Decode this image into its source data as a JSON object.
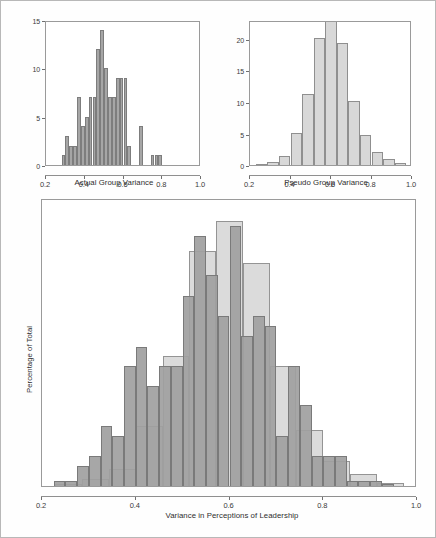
{
  "figure": {
    "background": "#ffffff",
    "frame_color": "#b8b8b8",
    "dark_color": "#a6a6a6",
    "light_color": "#d8d8d8"
  },
  "chart_data": [
    {
      "type": "bar",
      "id": "actual-group-variance",
      "title": "",
      "xlabel": "Actual Group Variance",
      "ylabel": "",
      "xlim": [
        0.2,
        1.0
      ],
      "ylim": [
        0,
        15
      ],
      "xticks": [
        "0.2",
        "0.4",
        "0.6",
        "0.8",
        "1.0"
      ],
      "xtick_values": [
        0.2,
        0.4,
        0.6,
        0.8,
        1.0
      ],
      "yticks": [
        "0",
        "5",
        "10",
        "15"
      ],
      "ytick_values": [
        0,
        5,
        10,
        15
      ],
      "grid": false,
      "legend": "none",
      "bin_width": 0.02,
      "series": [
        {
          "name": "Actual Group Variance",
          "color": "#a6a6a6",
          "bins": [
            0.28,
            0.3,
            0.32,
            0.34,
            0.36,
            0.38,
            0.4,
            0.42,
            0.44,
            0.46,
            0.48,
            0.5,
            0.52,
            0.54,
            0.56,
            0.58,
            0.6,
            0.62,
            0.64,
            0.66,
            0.68,
            0.7,
            0.72,
            0.74,
            0.76,
            0.78,
            0.8
          ],
          "values": [
            1,
            3,
            2,
            2,
            7,
            4,
            5,
            7,
            7,
            12,
            14,
            10,
            7,
            7,
            9,
            9,
            9,
            2,
            0,
            0,
            4,
            0,
            0,
            1,
            1,
            1,
            0
          ]
        }
      ]
    },
    {
      "type": "bar",
      "id": "pseudo-group-variance",
      "title": "",
      "xlabel": "Pseudo Group Variance",
      "ylabel": "",
      "xlim": [
        0.2,
        1.0
      ],
      "ylim": [
        0,
        23
      ],
      "xticks": [
        "0.2",
        "0.4",
        "0.6",
        "0.8",
        "1.0"
      ],
      "xtick_values": [
        0.2,
        0.4,
        0.6,
        0.8,
        1.0
      ],
      "yticks": [
        "0",
        "5",
        "10",
        "15",
        "20"
      ],
      "ytick_values": [
        0,
        5,
        10,
        15,
        20
      ],
      "grid": false,
      "legend": "none",
      "bin_width": 0.0571,
      "series": [
        {
          "name": "Pseudo Group Variance",
          "color": "#d8d8d8",
          "bins": [
            0.2286,
            0.2857,
            0.3429,
            0.4,
            0.4571,
            0.5143,
            0.5714,
            0.6286,
            0.6857,
            0.7429,
            0.8,
            0.8571,
            0.9143
          ],
          "values": [
            0.1,
            0.4,
            1.4,
            5.0,
            11.2,
            20.2,
            23.0,
            19.3,
            10.2,
            4.8,
            2.1,
            0.9,
            0.3
          ]
        }
      ]
    },
    {
      "type": "bar",
      "id": "overlay-variance-in-perceptions-of-leadership",
      "title": "",
      "xlabel": "Variance in Perceptions of Leadership",
      "ylabel": "Percentage of Total",
      "xlim": [
        0.2,
        1.0
      ],
      "ylim": [
        0,
        25
      ],
      "xticks": [
        "0.2",
        "0.4",
        "0.6",
        "0.8",
        "1.0"
      ],
      "xtick_values": [
        0.2,
        0.4,
        0.6,
        0.8,
        1.0
      ],
      "yticks": [],
      "ytick_values": [],
      "grid": false,
      "legend": "none",
      "series": [
        {
          "name": "Actual",
          "color": "#a0a0a0",
          "bin_width": 0.025,
          "bins": [
            0.225,
            0.25,
            0.275,
            0.3,
            0.325,
            0.35,
            0.375,
            0.4,
            0.425,
            0.45,
            0.475,
            0.5,
            0.525,
            0.55,
            0.575,
            0.6,
            0.625,
            0.65,
            0.675,
            0.7,
            0.725,
            0.75,
            0.775,
            0.8,
            0.825,
            0.85,
            0.875,
            0.9,
            0.925
          ],
          "values": [
            0.4,
            0.4,
            1.7,
            2.6,
            5.2,
            4.3,
            10.4,
            12.1,
            8.7,
            10.4,
            10.4,
            16.5,
            21.7,
            18.3,
            14.8,
            22.6,
            13.0,
            14.8,
            13.9,
            4.3,
            10.4,
            7.0,
            2.6,
            2.6,
            2.6,
            0.4,
            0.4,
            0.4,
            0.2
          ]
        },
        {
          "name": "Pseudo",
          "color": "#d6d6d6",
          "bin_width": 0.0571,
          "bins": [
            0.2286,
            0.2857,
            0.3429,
            0.4,
            0.4571,
            0.5143,
            0.5714,
            0.6286,
            0.6857,
            0.7429,
            0.8,
            0.8571,
            0.9143
          ],
          "values": [
            0.2,
            0.6,
            1.5,
            5.2,
            11.3,
            20.4,
            23.0,
            19.4,
            10.4,
            4.9,
            2.2,
            1.0,
            0.3
          ]
        }
      ]
    }
  ],
  "panels": {
    "actual": {
      "xlabel": "Actual Group Variance",
      "yticks": [
        "15",
        "10",
        "5",
        "0"
      ],
      "xticks": [
        "0.2",
        "0.4",
        "0.6",
        "0.8",
        "1.0"
      ]
    },
    "pseudo": {
      "xlabel": "Pseudo Group Variance",
      "yticks": [
        "20",
        "15",
        "10",
        "5",
        "0"
      ],
      "xticks": [
        "0.2",
        "0.4",
        "0.6",
        "0.8",
        "1.0"
      ]
    },
    "overlay": {
      "xlabel": "Variance in Perceptions of Leadership",
      "ylabel": "Percentage of Total",
      "xticks": [
        "0.2",
        "0.4",
        "0.6",
        "0.8",
        "1.0"
      ]
    }
  }
}
